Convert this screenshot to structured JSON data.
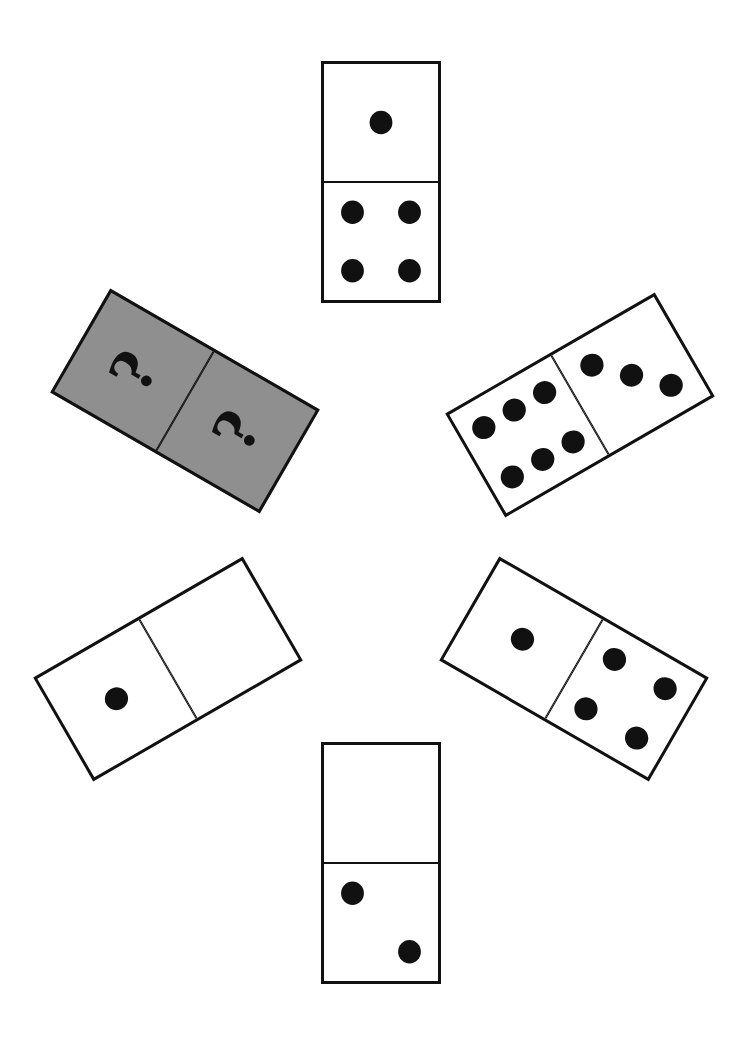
{
  "puzzle": {
    "title": "Domino sequence puzzle",
    "colors": {
      "tile": "#ffffff",
      "hidden_tile": "#8f8f8f",
      "pip": "#111111",
      "outline": "#111111"
    },
    "dominoes": [
      {
        "id": "top",
        "values": [
          1,
          4
        ],
        "hidden": false,
        "center": [
          381,
          182
        ],
        "rotation": 0
      },
      {
        "id": "upper-right",
        "values": [
          3,
          6
        ],
        "hidden": false,
        "center": [
          580,
          405
        ],
        "rotation": 60
      },
      {
        "id": "lower-right",
        "values": [
          1,
          4
        ],
        "hidden": false,
        "center": [
          574,
          669
        ],
        "rotation": -60
      },
      {
        "id": "bottom",
        "values": [
          0,
          2
        ],
        "hidden": false,
        "center": [
          381,
          863
        ],
        "rotation": 0
      },
      {
        "id": "lower-left",
        "values": [
          0,
          1
        ],
        "hidden": false,
        "center": [
          168,
          669
        ],
        "rotation": 60
      },
      {
        "id": "upper-left",
        "values": [
          "?",
          "?"
        ],
        "hidden": true,
        "center": [
          185,
          401
        ],
        "rotation": -60
      }
    ],
    "unknown_label": "?"
  }
}
